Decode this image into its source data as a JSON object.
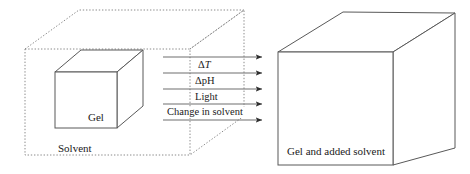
{
  "figure": {
    "left_box": {
      "container_label": "Solvent",
      "inner_cube_label": "Gel",
      "container_style": "dotted",
      "inner_style": "solid"
    },
    "right_box": {
      "label": "Gel and added solvent",
      "style": "solid"
    },
    "stimuli": [
      {
        "id": "delta-t",
        "prefix": "Δ",
        "symbol": "T",
        "symbol_italic": true,
        "text": "ΔT"
      },
      {
        "id": "delta-ph",
        "prefix": "Δ",
        "symbol": "pH",
        "symbol_italic": false,
        "text": "ΔpH"
      },
      {
        "id": "light",
        "prefix": "",
        "symbol": "Light",
        "symbol_italic": false,
        "text": "Light"
      },
      {
        "id": "change-in-solvent",
        "prefix": "",
        "symbol": "Change in solvent",
        "symbol_italic": false,
        "text": "Change in solvent"
      }
    ],
    "arrow_count": 5,
    "colors": {
      "stroke": "#5a5a5a",
      "stroke_dark": "#3c3c3c",
      "text": "#1a1a1a",
      "background": "#ffffff"
    }
  }
}
